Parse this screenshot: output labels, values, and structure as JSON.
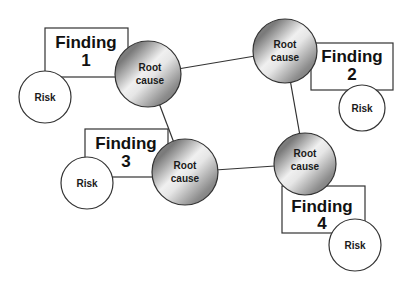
{
  "diagram": {
    "colors": {
      "line": "#333333",
      "box_fill": "#ffffff",
      "sphere_dark": "#6e6e6e",
      "sphere_light": "#f2f2f2"
    },
    "root_causes": [
      {
        "id": "rc1",
        "line1": "Root",
        "line2": "cause",
        "cx": 148,
        "cy": 74,
        "r": 33
      },
      {
        "id": "rc2",
        "line1": "Root",
        "line2": "cause",
        "cx": 285,
        "cy": 51,
        "r": 32
      },
      {
        "id": "rc3",
        "line1": "Root",
        "line2": "cause",
        "cx": 185,
        "cy": 172,
        "r": 33
      },
      {
        "id": "rc4",
        "line1": "Root",
        "line2": "cause",
        "cx": 305,
        "cy": 164,
        "r": 31
      }
    ],
    "findings": [
      {
        "id": "f1",
        "line1": "Finding",
        "line2": "1",
        "x": 45,
        "y": 28,
        "w": 83,
        "h": 49
      },
      {
        "id": "f2",
        "line1": "Finding",
        "line2": "2",
        "x": 311,
        "y": 43,
        "w": 82,
        "h": 47
      },
      {
        "id": "f3",
        "line1": "Finding",
        "line2": "3",
        "x": 85,
        "y": 129,
        "w": 83,
        "h": 48
      },
      {
        "id": "f4",
        "line1": "Finding",
        "line2": "4",
        "x": 282,
        "y": 186,
        "w": 83,
        "h": 47
      }
    ],
    "risks": [
      {
        "id": "r1",
        "label": "Risk",
        "cx": 45,
        "cy": 97,
        "r": 26
      },
      {
        "id": "r2",
        "label": "Risk",
        "cx": 362,
        "cy": 108,
        "r": 23
      },
      {
        "id": "r3",
        "label": "Risk",
        "cx": 87,
        "cy": 183,
        "r": 26
      },
      {
        "id": "r4",
        "label": "Risk",
        "cx": 355,
        "cy": 245,
        "r": 26
      }
    ],
    "connections": [
      {
        "from": "rc1",
        "to": "rc2"
      },
      {
        "from": "rc1",
        "to": "rc3"
      },
      {
        "from": "rc2",
        "to": "rc4"
      },
      {
        "from": "rc3",
        "to": "rc4"
      }
    ]
  }
}
